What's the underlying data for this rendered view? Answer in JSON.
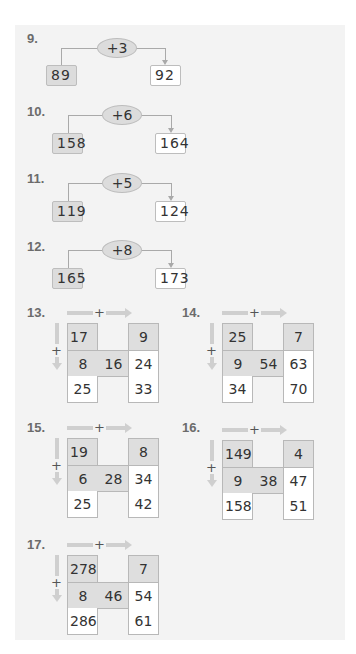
{
  "addition_chains": [
    {
      "number": "9.",
      "operator": "+3",
      "start": "89",
      "result": "92"
    },
    {
      "number": "10.",
      "operator": "+6",
      "start": "158",
      "result": "164"
    },
    {
      "number": "11.",
      "operator": "+5",
      "start": "119",
      "result": "124"
    },
    {
      "number": "12.",
      "operator": "+8",
      "start": "165",
      "result": "173"
    }
  ],
  "grids": [
    {
      "number": "13.",
      "plus": "+",
      "top_left": "17",
      "top_right": "9",
      "mid_left": "8",
      "mid_center": "16",
      "mid_right": "24",
      "bottom_left": "25",
      "bottom_right": "33"
    },
    {
      "number": "14.",
      "plus": "+",
      "top_left": "25",
      "top_right": "7",
      "mid_left": "9",
      "mid_center": "54",
      "mid_right": "63",
      "bottom_left": "34",
      "bottom_right": "70"
    },
    {
      "number": "15.",
      "plus": "+",
      "top_left": "19",
      "top_right": "8",
      "mid_left": "6",
      "mid_center": "28",
      "mid_right": "34",
      "bottom_left": "25",
      "bottom_right": "42"
    },
    {
      "number": "16.",
      "plus": "+",
      "top_left": "149",
      "top_right": "4",
      "mid_left": "9",
      "mid_center": "38",
      "mid_right": "47",
      "bottom_left": "158",
      "bottom_right": "51"
    },
    {
      "number": "17.",
      "plus": "+",
      "top_left": "278",
      "top_right": "7",
      "mid_left": "8",
      "mid_center": "46",
      "mid_right": "54",
      "bottom_left": "286",
      "bottom_right": "61"
    }
  ],
  "colors": {
    "panel_background": "#f3f3f3",
    "shaded_cell": "#dedede",
    "arrow": "#cfcfcf",
    "label": "#6b6b6b"
  }
}
